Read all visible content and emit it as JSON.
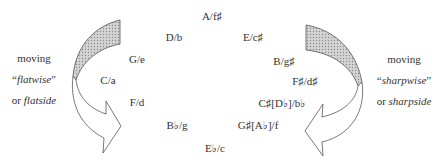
{
  "diagram": {
    "keys": [
      {
        "label": "A/f♯",
        "x": 212,
        "y": 16
      },
      {
        "label": "D/b",
        "x": 174,
        "y": 37
      },
      {
        "label": "E/c♯",
        "x": 253,
        "y": 37
      },
      {
        "label": "G/e",
        "x": 137,
        "y": 59
      },
      {
        "label": "B/g♯",
        "x": 284,
        "y": 61
      },
      {
        "label": "C/a",
        "x": 108,
        "y": 80
      },
      {
        "label": "F♯/d♯",
        "x": 305,
        "y": 81
      },
      {
        "label": "F/d",
        "x": 137,
        "y": 102
      },
      {
        "label": "C♯[D♭]/b♭",
        "x": 282,
        "y": 103
      },
      {
        "label": "B♭/g",
        "x": 177,
        "y": 125
      },
      {
        "label": "G♯[A♭]/f",
        "x": 258,
        "y": 125
      },
      {
        "label": "E♭/c",
        "x": 215,
        "y": 148
      }
    ],
    "left_caption": {
      "line1": "moving",
      "line2_quote_open": "“",
      "line2_italic": "flatwise",
      "line2_quote_close": "”",
      "line3_prefix": "or ",
      "line3_italic": "flatside"
    },
    "right_caption": {
      "line1": "moving",
      "line2_quote_open": "“",
      "line2_italic": "sharpwise",
      "line2_quote_close": "”",
      "line3_prefix": "or ",
      "line3_italic": "sharpside"
    },
    "arrows": [
      {
        "name": "flatwise-arrow",
        "direction": "counterclockwise",
        "side": "left"
      },
      {
        "name": "sharpwise-arrow",
        "direction": "clockwise",
        "side": "right"
      }
    ],
    "colors": {
      "stroke": "#555555",
      "shade": "#c8c8c8",
      "text": "#333333"
    }
  }
}
